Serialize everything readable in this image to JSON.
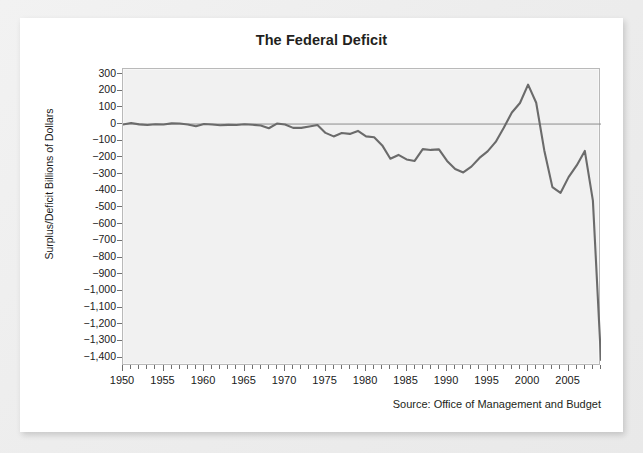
{
  "card": {
    "title": "The Federal Deficit",
    "source_note": "Source: Office of Management and Budget"
  },
  "chart_data": {
    "type": "line",
    "title": "The Federal Deficit",
    "xlabel": "",
    "ylabel": "Surplus/Deficit Billions of Dollars",
    "xlim": [
      1950,
      2009
    ],
    "ylim": [
      -1450,
      330
    ],
    "grid": false,
    "legend": null,
    "zero_reference_line": true,
    "y_ticks": [
      300,
      200,
      100,
      0,
      -100,
      -200,
      -300,
      -400,
      -500,
      -600,
      -700,
      -800,
      -900,
      -1000,
      -1100,
      -1200,
      -1300,
      -1400
    ],
    "y_tick_labels": [
      "300",
      "200",
      "100",
      "0",
      "−100",
      "−200",
      "−300",
      "-400",
      "-500",
      "−600",
      "−700",
      "−800",
      "−900",
      "−1,000",
      "−1,100",
      "−1,200",
      "−1,300",
      "−1,400"
    ],
    "x_ticks": [
      1950,
      1955,
      1960,
      1965,
      1970,
      1975,
      1980,
      1985,
      1990,
      1995,
      2000,
      2005
    ],
    "x_tick_labels": [
      "1950",
      "1955",
      "1960",
      "1965",
      "1970",
      "1975",
      "1980",
      "1985",
      "1990",
      "1995",
      "2000",
      "2005"
    ],
    "x_minor_tick_step": 1,
    "line_color": "#6b6b6b",
    "plot_background": "#f1f1f1",
    "series": [
      {
        "name": "Surplus/Deficit",
        "x": [
          1950,
          1951,
          1952,
          1953,
          1954,
          1955,
          1956,
          1957,
          1958,
          1959,
          1960,
          1961,
          1962,
          1963,
          1964,
          1965,
          1966,
          1967,
          1968,
          1969,
          1970,
          1971,
          1972,
          1973,
          1974,
          1975,
          1976,
          1977,
          1978,
          1979,
          1980,
          1981,
          1982,
          1983,
          1984,
          1985,
          1986,
          1987,
          1988,
          1989,
          1990,
          1991,
          1992,
          1993,
          1994,
          1995,
          1996,
          1997,
          1998,
          1999,
          2000,
          2001,
          2002,
          2003,
          2004,
          2005,
          2006,
          2007,
          2008,
          2009
        ],
        "values": [
          -3,
          6,
          -2,
          -6,
          -1,
          -3,
          4,
          3,
          -3,
          -13,
          0,
          -3,
          -7,
          -5,
          -6,
          -1,
          -4,
          -9,
          -25,
          3,
          -3,
          -23,
          -23,
          -15,
          -6,
          -53,
          -74,
          -54,
          -59,
          -41,
          -74,
          -79,
          -128,
          -208,
          -185,
          -212,
          -221,
          -150,
          -155,
          -152,
          -221,
          -269,
          -290,
          -255,
          -203,
          -164,
          -107,
          -22,
          69,
          126,
          236,
          128,
          -158,
          -378,
          -413,
          -318,
          -248,
          -161,
          -459,
          -1413
        ]
      }
    ]
  }
}
